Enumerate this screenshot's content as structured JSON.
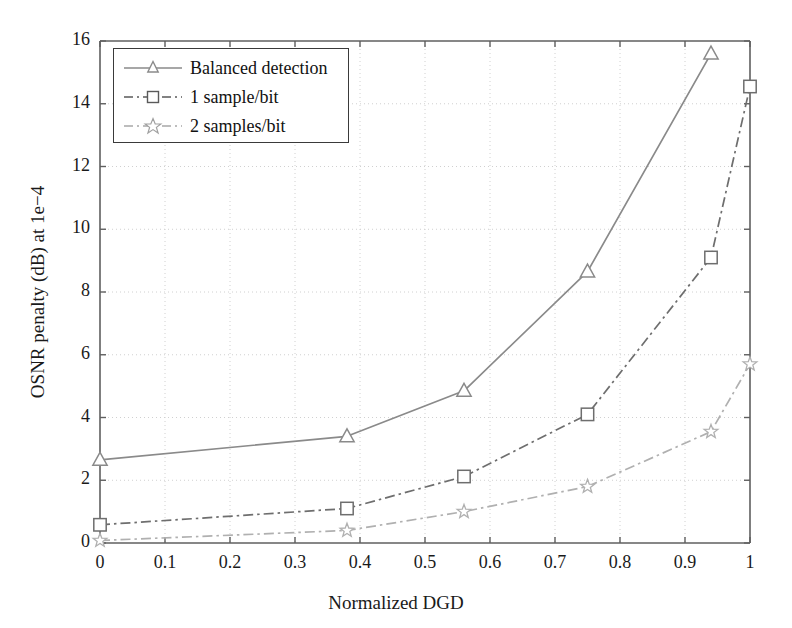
{
  "chart_data": {
    "type": "line",
    "title": "",
    "xlabel": "Normalized DGD",
    "ylabel": "OSNR penalty (dB) at 1e−4",
    "xlim": [
      0,
      1
    ],
    "ylim": [
      0,
      16
    ],
    "xticks": [
      "0",
      "0.1",
      "0.2",
      "0.3",
      "0.4",
      "0.5",
      "0.6",
      "0.7",
      "0.8",
      "0.9",
      "1"
    ],
    "xtick_values": [
      0,
      0.1,
      0.2,
      0.3,
      0.4,
      0.5,
      0.6,
      0.7,
      0.8,
      0.9,
      1.0
    ],
    "yticks": [
      "0",
      "2",
      "4",
      "6",
      "8",
      "10",
      "12",
      "14",
      "16"
    ],
    "ytick_values": [
      0,
      2,
      4,
      6,
      8,
      10,
      12,
      14,
      16
    ],
    "grid": true,
    "grid_style": "dotted",
    "legend_position": "upper left",
    "series": [
      {
        "name": "Balanced detection",
        "marker": "triangle",
        "linestyle": "solid",
        "color": "#8a8a8a",
        "x": [
          0,
          0.38,
          0.56,
          0.75,
          0.94
        ],
        "y": [
          2.65,
          3.4,
          4.85,
          8.65,
          15.6
        ]
      },
      {
        "name": "1 sample/bit",
        "marker": "square",
        "linestyle": "dashdot",
        "color": "#6e6e6e",
        "x": [
          0,
          0.38,
          0.56,
          0.75,
          0.94,
          1.0
        ],
        "y": [
          0.58,
          1.1,
          2.12,
          4.1,
          9.1,
          14.55
        ]
      },
      {
        "name": "2 samples/bit",
        "marker": "star",
        "linestyle": "dashdot",
        "color": "#b0b0b0",
        "x": [
          0,
          0.38,
          0.56,
          0.75,
          0.94,
          1.0
        ],
        "y": [
          0.08,
          0.4,
          1.0,
          1.8,
          3.55,
          5.7
        ]
      }
    ]
  },
  "legend": {
    "items": [
      {
        "label": "Balanced detection"
      },
      {
        "label": "1 sample/bit"
      },
      {
        "label": "2 samples/bit"
      }
    ]
  },
  "colors": {
    "axis": "#5f5f5f",
    "grid": "#d0d0d0",
    "text": "#1a1a1a",
    "series_1": "#8a8a8a",
    "series_2": "#6e6e6e",
    "series_3": "#b0b0b0",
    "background": "#ffffff"
  }
}
